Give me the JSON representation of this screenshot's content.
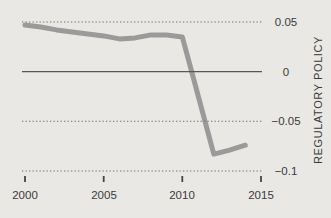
{
  "chart_data": {
    "type": "line",
    "title": "",
    "xlabel": "",
    "ylabel": "REGULATORY POLICY",
    "series_name": "regulatory policy index",
    "x": [
      2000,
      2001,
      2002,
      2003,
      2004,
      2005,
      2006,
      2007,
      2008,
      2009,
      2010,
      2011,
      2012,
      2013,
      2014
    ],
    "values": [
      0.047,
      0.045,
      0.042,
      0.04,
      0.038,
      0.036,
      0.033,
      0.034,
      0.037,
      0.037,
      0.035,
      -0.024,
      -0.083,
      -0.079,
      -0.074
    ],
    "x_ticks": [
      2000,
      2005,
      2010,
      2015
    ],
    "x_tick_labels": [
      "2000",
      "2005",
      "2010",
      "2015"
    ],
    "y_ticks": [
      0.05,
      0,
      -0.05,
      -0.1
    ],
    "y_tick_labels": [
      "0.05",
      "0",
      "−0.05",
      "−0.1"
    ],
    "xlim": [
      2000,
      2015
    ],
    "ylim": [
      -0.1,
      0.05
    ],
    "grid": "horizontal dotted lines at 0.05, -0.05, -0.1; solid line at 0; drawn over the series",
    "legend": "none",
    "colors": {
      "background": "#e9e8e5",
      "line": "#9a9a9a",
      "dotted_grid": "#6b6b6b",
      "zero_line": "#58585a",
      "tick_mark": "#444444",
      "text": "#3a3a3a"
    }
  }
}
